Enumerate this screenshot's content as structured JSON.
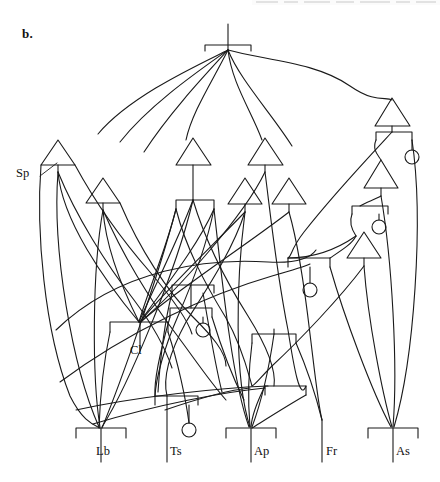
{
  "figure": {
    "panel_label": "b.",
    "type": "tokogenetic-network-diagram",
    "width": 440,
    "height": 482,
    "background_color": "#ffffff",
    "line_color": "#1a1a1a",
    "caption_labels": {
      "sp_annotation": "Sp",
      "cl_annotation": "Cl"
    },
    "terminal_labels": [
      {
        "id": "lb",
        "text": "Lb",
        "x": 100,
        "y": 437
      },
      {
        "id": "ts",
        "text": "Ts",
        "x": 175,
        "y": 437
      },
      {
        "id": "ap",
        "text": "Ap",
        "x": 250,
        "y": 437
      },
      {
        "id": "fr",
        "text": "Fr",
        "x": 327,
        "y": 437
      },
      {
        "id": "as",
        "text": "As",
        "x": 392,
        "y": 437
      }
    ],
    "annotations": [
      {
        "id": "sp",
        "text": "Sp",
        "x": 28,
        "y": 175,
        "points_to_x": 58,
        "points_to_y": 160
      },
      {
        "id": "cl",
        "text": "Cl",
        "x": 138,
        "y": 352,
        "points_to_x": 140,
        "points_to_y": 330
      }
    ],
    "node_glyphs": {
      "triangle": "apex-up-triangle",
      "bracket": "down-turned-bracket",
      "circle": "open-circle-terminal",
      "root": "stem-with-bracket"
    }
  }
}
